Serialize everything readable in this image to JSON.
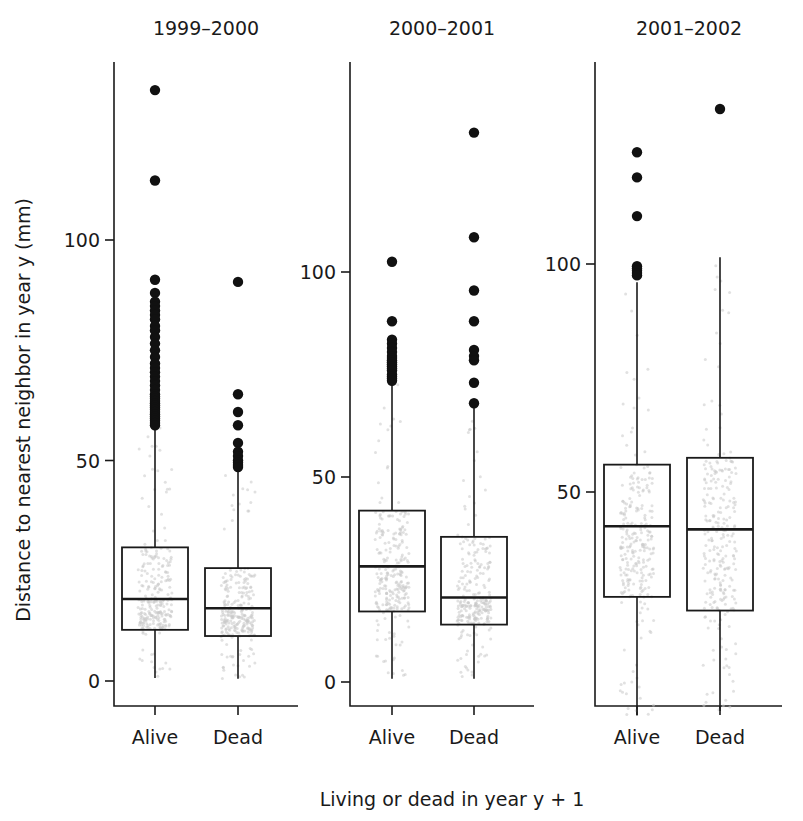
{
  "figure": {
    "width": 803,
    "height": 821,
    "background": "#ffffff",
    "ink": "#1a1a1a",
    "jitter_color": "#c9c9c9"
  },
  "axis": {
    "ylabel": "Distance to nearest neighbor in year y (mm)",
    "xlabel": "Living or dead in year y + 1"
  },
  "chart_data": {
    "type": "box",
    "title": "",
    "subtitle": "",
    "xlabel": "Living or dead in year y + 1",
    "ylabel": "Distance to nearest neighbor in year y (mm)",
    "grid": false,
    "legend": "none",
    "units": "mm",
    "categories": [
      "Alive",
      "Dead"
    ],
    "panel_titles": [
      "1999–2000",
      "2000–2001",
      "2001–2002"
    ],
    "panels": [
      {
        "title": "1999–2000",
        "ylim": [
          -6,
          145
        ],
        "yticks": [
          0,
          50,
          100
        ],
        "ytick_labels": [
          "0",
          "50",
          "100"
        ],
        "boxes": [
          {
            "category": "Alive",
            "q1": 11.6,
            "median": 18.6,
            "q3": 30.3,
            "whisker_low": 0.7,
            "whisker_high": 57.5,
            "outliers": [
              134.0,
              113.5,
              91.0,
              88.0,
              86.0,
              85.0,
              84.0,
              83.0,
              82.0,
              80.5,
              79.5,
              78.0,
              76.5,
              75.0,
              73.5,
              72.0,
              71.0,
              70.0,
              69.0,
              68.0,
              67.0,
              66.0,
              65.0,
              64.5,
              64.0,
              63.5,
              63.0,
              62.5,
              62.0,
              61.5,
              61.0,
              60.5,
              60.0,
              59.5,
              59.0,
              58.5,
              58.0
            ]
          },
          {
            "category": "Dead",
            "q1": 10.2,
            "median": 16.5,
            "q3": 25.6,
            "whisker_low": 0.5,
            "whisker_high": 47.5,
            "outliers": [
              90.5,
              65.0,
              61.0,
              58.0,
              54.0,
              52.0,
              51.0,
              50.0,
              49.5,
              49.0,
              48.5
            ]
          }
        ]
      },
      {
        "title": "2000–2001",
        "ylim": [
          -6,
          145
        ],
        "yticks": [
          0,
          50,
          100
        ],
        "ytick_labels": [
          "0",
          "50",
          "100"
        ],
        "boxes": [
          {
            "category": "Alive",
            "q1": 17.2,
            "median": 28.2,
            "q3": 41.8,
            "whisker_low": 0.8,
            "whisker_high": 72.5,
            "outliers": [
              102.5,
              88.0,
              83.5,
              82.5,
              81.5,
              80.5,
              79.5,
              79.0,
              78.5,
              78.0,
              77.5,
              77.0,
              76.5,
              76.0,
              75.0,
              74.5,
              74.0,
              73.5
            ]
          },
          {
            "category": "Dead",
            "q1": 14.0,
            "median": 20.6,
            "q3": 35.4,
            "whisker_low": 0.8,
            "whisker_high": 67.5,
            "outliers": [
              134.0,
              108.5,
              95.5,
              88.0,
              81.0,
              79.5,
              78.5,
              73.0,
              68.0
            ]
          }
        ]
      },
      {
        "title": "2001–2002",
        "ylim": [
          -6,
          145
        ],
        "yticks": [
          50,
          100
        ],
        "ytick_labels": [
          "50",
          "100"
        ],
        "boxes": [
          {
            "category": "Alive",
            "q1": 27.0,
            "median": 42.5,
            "q3": 56.0,
            "whisker_low": 1.0,
            "whisker_high": 96.0,
            "outliers": [
              124.5,
              119.0,
              110.5,
              99.5,
              99.0,
              98.5,
              98.0,
              97.5
            ]
          },
          {
            "category": "Dead",
            "q1": 24.0,
            "median": 41.8,
            "q3": 57.5,
            "whisker_low": 2.0,
            "whisker_high": 101.5,
            "outliers": [
              134.0
            ]
          }
        ]
      }
    ]
  }
}
